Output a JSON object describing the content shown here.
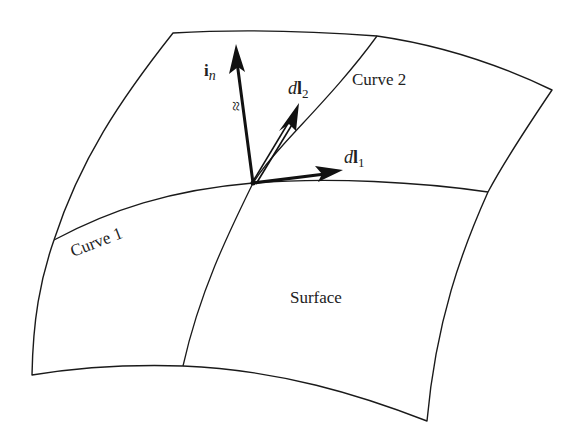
{
  "figure": {
    "labels": {
      "normal_main": "i",
      "normal_sub": "n",
      "dl2_d": "d",
      "dl2_l": "l",
      "dl2_sub": "2",
      "dl1_d": "d",
      "dl1_l": "l",
      "dl1_sub": "1",
      "curve1": "Curve 1",
      "curve2": "Curve 2",
      "surface": "Surface",
      "approx_mark": "≈"
    },
    "colors": {
      "line": "#1a1a1a",
      "background": "#ffffff"
    }
  }
}
